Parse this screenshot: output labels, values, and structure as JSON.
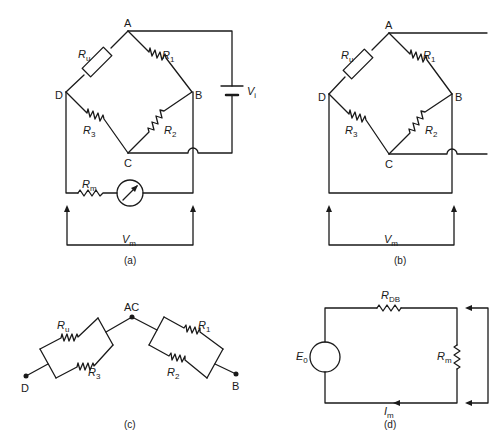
{
  "panels": {
    "a": {
      "caption": "(a)",
      "nodes": {
        "A": "A",
        "B": "B",
        "C": "C",
        "D": "D"
      },
      "resistors": {
        "Ru": {
          "main": "R",
          "sub": "u"
        },
        "R1": {
          "main": "R",
          "sub": "1"
        },
        "R2": {
          "main": "R",
          "sub": "2"
        },
        "R3": {
          "main": "R",
          "sub": "3"
        },
        "Rm": {
          "main": "R",
          "sub": "m"
        }
      },
      "source": {
        "main": "V",
        "sub": "i"
      },
      "measure": {
        "main": "V",
        "sub": "m"
      }
    },
    "b": {
      "caption": "(b)",
      "nodes": {
        "A": "A",
        "B": "B",
        "C": "C",
        "D": "D"
      },
      "resistors": {
        "Ru": {
          "main": "R",
          "sub": "u"
        },
        "R1": {
          "main": "R",
          "sub": "1"
        },
        "R2": {
          "main": "R",
          "sub": "2"
        },
        "R3": {
          "main": "R",
          "sub": "3"
        }
      },
      "measure": {
        "main": "V",
        "sub": "m"
      }
    },
    "c": {
      "caption": "(c)",
      "nodes": {
        "D": "D",
        "AC": "AC",
        "B": "B"
      },
      "resistors": {
        "Ru": {
          "main": "R",
          "sub": "u"
        },
        "R3": {
          "main": "R",
          "sub": "3"
        },
        "R1": {
          "main": "R",
          "sub": "1"
        },
        "R2": {
          "main": "R",
          "sub": "2"
        }
      }
    },
    "d": {
      "caption": "(d)",
      "source": {
        "main": "E",
        "sub": "0"
      },
      "resistors": {
        "RDB": {
          "main": "R",
          "sub": "DB"
        },
        "Rm": {
          "main": "R",
          "sub": "m"
        }
      },
      "current": {
        "main": "I",
        "sub": "m"
      }
    }
  }
}
